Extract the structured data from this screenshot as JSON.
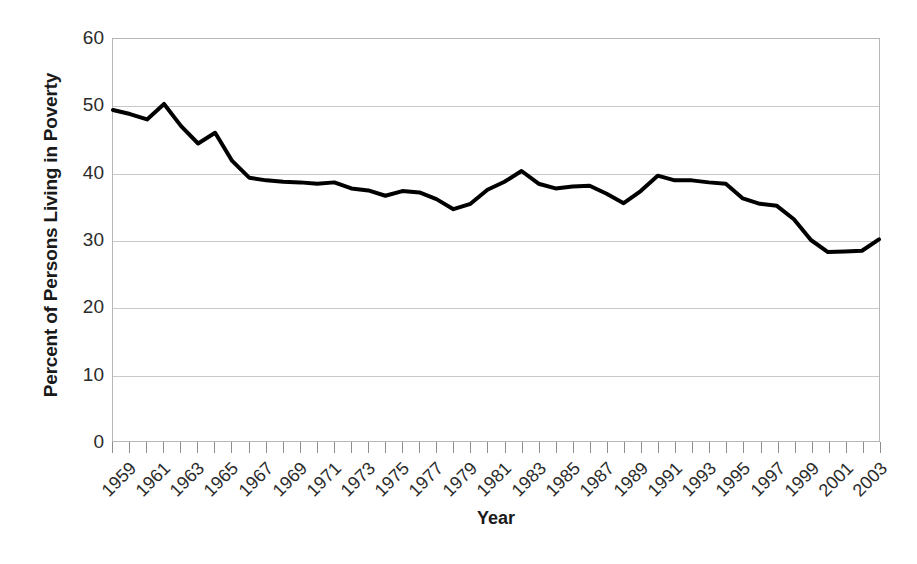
{
  "chart_data": {
    "type": "line",
    "title": "",
    "xlabel": "Year",
    "ylabel": "Percent of Persons Living in Poverty",
    "xlim": [
      1959,
      2004
    ],
    "ylim": [
      0,
      60
    ],
    "ytick_labels": [
      "0",
      "10",
      "20",
      "30",
      "40",
      "50",
      "60"
    ],
    "ytick_values": [
      0,
      10,
      20,
      30,
      40,
      50,
      60
    ],
    "xtick_labels": [
      "1959",
      "1961",
      "1963",
      "1965",
      "1967",
      "1969",
      "1971",
      "1973",
      "1975",
      "1977",
      "1979",
      "1981",
      "1983",
      "1985",
      "1987",
      "1989",
      "1991",
      "1993",
      "1995",
      "1997",
      "1999",
      "2001",
      "2003"
    ],
    "xtick_values": [
      1959,
      1961,
      1963,
      1965,
      1967,
      1969,
      1971,
      1973,
      1975,
      1977,
      1979,
      1981,
      1983,
      1985,
      1987,
      1989,
      1991,
      1993,
      1995,
      1997,
      1999,
      2001,
      2003
    ],
    "grid": true,
    "grid_axis": "y",
    "legend": false,
    "line_color": "#000000",
    "line_width": 4,
    "x": [
      1959,
      1960,
      1961,
      1962,
      1963,
      1964,
      1965,
      1966,
      1967,
      1968,
      1969,
      1970,
      1971,
      1972,
      1973,
      1974,
      1975,
      1976,
      1977,
      1978,
      1979,
      1980,
      1981,
      1982,
      1983,
      1984,
      1985,
      1986,
      1987,
      1988,
      1989,
      1990,
      1991,
      1992,
      1993,
      1994,
      1995,
      1996,
      1997,
      1998,
      1999,
      2000,
      2001,
      2002,
      2003,
      2004
    ],
    "values": [
      49.4,
      48.8,
      48.0,
      50.3,
      47.0,
      44.4,
      46.0,
      41.8,
      39.3,
      38.9,
      38.7,
      38.6,
      38.4,
      38.6,
      37.7,
      37.4,
      36.6,
      37.3,
      37.1,
      36.1,
      34.6,
      35.4,
      37.5,
      38.7,
      40.3,
      38.4,
      37.7,
      38.0,
      38.1,
      36.9,
      35.5,
      37.3,
      39.6,
      38.9,
      38.9,
      38.6,
      38.4,
      36.2,
      35.4,
      35.1,
      33.1,
      30.0,
      28.2,
      28.3,
      28.4,
      30.1
    ]
  },
  "axis": {
    "ylabel_text": "Percent of Persons Living in Poverty",
    "xlabel_text": "Year"
  }
}
